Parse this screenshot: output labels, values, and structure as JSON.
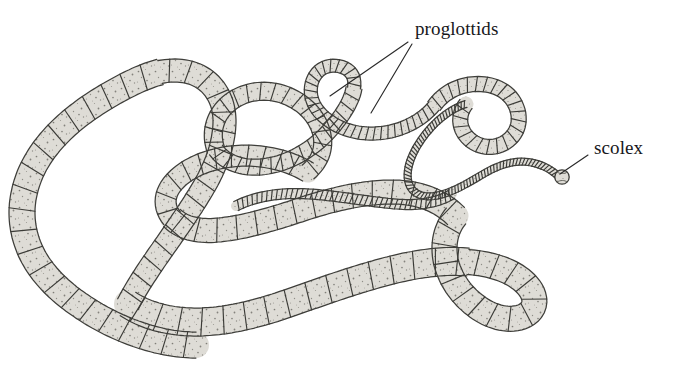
{
  "figure": {
    "background_color": "#ffffff",
    "ink_color": "#3a3a3a",
    "body_fill_color": "#dedcd6",
    "stipple_color": "#6e6c66",
    "label_color": "#17171b",
    "leader_color": "#2a2a2a"
  },
  "labels": {
    "proglottids": "proglottids",
    "scolex": "scolex"
  },
  "annotations": {
    "proglottids": {
      "text": "proglottids",
      "x": 415,
      "y": 19,
      "leaders": [
        {
          "x1": 408,
          "y1": 42,
          "x2": 330,
          "y2": 96
        },
        {
          "x1": 412,
          "y1": 44,
          "x2": 371,
          "y2": 113
        }
      ]
    },
    "scolex": {
      "text": "scolex",
      "x": 594,
      "y": 138,
      "leaders": [
        {
          "x1": 588,
          "y1": 155,
          "x2": 559,
          "y2": 175
        }
      ]
    }
  },
  "anatomy": {
    "scolex_knob": {
      "cx": 562,
      "cy": 177,
      "r": 7
    },
    "segment_counts": {
      "fine_neck": 74,
      "mid_strobila": 52,
      "gravid_terminal": 21
    },
    "description": "Segmented tapeworm body (strobila) coiled in loops, tapering from broad gravid proglottids at the free end to a fine neck terminating in a small rounded scolex."
  }
}
